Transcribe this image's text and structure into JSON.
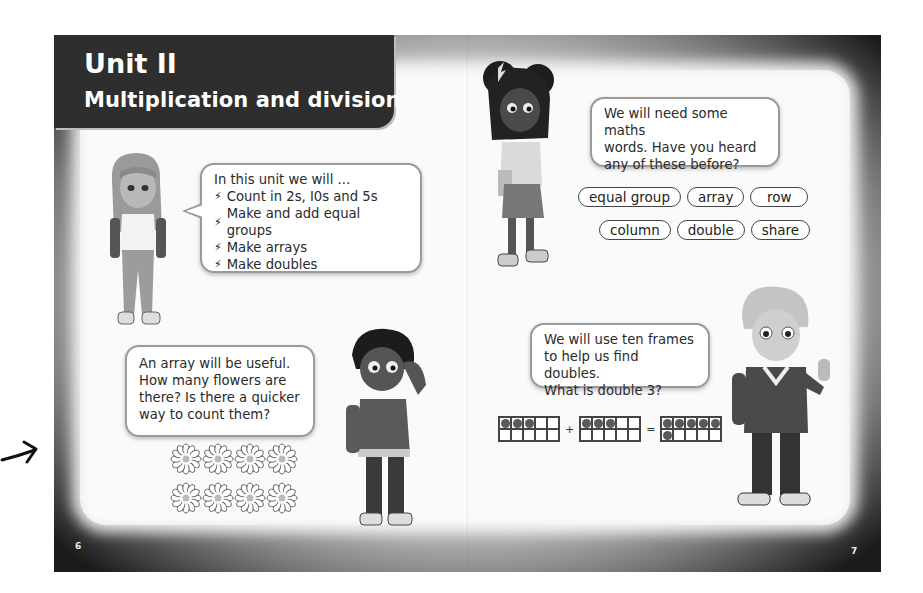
{
  "title": {
    "unit": "Unit II",
    "subtitle": "Multiplication and division"
  },
  "bubbles": {
    "intro": {
      "heading": "In this unit we will ...",
      "bullets": [
        "Count in 2s, I0s and 5s",
        "Make and add equal groups",
        "Make arrays",
        "Make doubles"
      ]
    },
    "vocab_prompt": {
      "lines": [
        "We will need some maths",
        "words. Have you heard",
        "any of these before?"
      ]
    },
    "array": {
      "lines": [
        "An array will be useful.",
        "How many flowers are",
        "there? Is there a quicker",
        "way to count them?"
      ]
    },
    "doubles": {
      "lines": [
        "We will use ten frames",
        "to help us find doubles.",
        "What is double 3?"
      ]
    }
  },
  "vocabulary": {
    "row1": [
      "equal group",
      "array",
      "row"
    ],
    "row2": [
      "column",
      "double",
      "share"
    ]
  },
  "flower_array": {
    "rows": 2,
    "columns": 4
  },
  "ten_frames": {
    "first": 3,
    "plus": "+",
    "second": 3,
    "equals": "=",
    "result": 6
  },
  "page_numbers": {
    "left": "6",
    "right": "7"
  },
  "icons": {
    "bullet": "lightning-bolt-icon",
    "arrow": "hand-drawn-arrow-icon"
  },
  "colors": {
    "title_bg": "#2e2e2e",
    "frame_dark": "#0c0c0c",
    "panel": "#fafafa",
    "bubble_border": "#9a9a9a"
  }
}
